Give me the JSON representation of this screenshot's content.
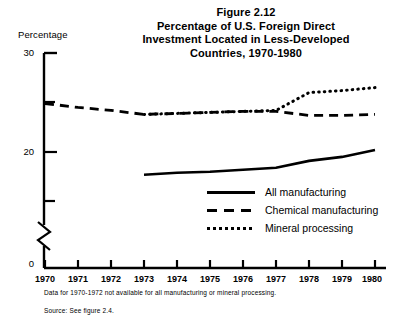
{
  "figure": {
    "title_lines": [
      "Figure 2.12",
      "Percentage of U.S. Foreign Direct",
      "Investment Located in Less-Developed",
      "Countries, 1970-1980"
    ],
    "footnote": "Data for 1970-1972 not available for all manufacturing or mineral processing.",
    "source": "Source: See figure 2.4."
  },
  "legend": {
    "items": [
      {
        "label": "All manufacturing",
        "style": "solid"
      },
      {
        "label": "Chemical manufacturing",
        "style": "dashed"
      },
      {
        "label": "Mineral processing",
        "style": "dotted"
      }
    ]
  },
  "chart_data": {
    "type": "line",
    "title": "Percentage of U.S. Foreign Direct Investment Located in Less-Developed Countries, 1970-1980",
    "xlabel": "",
    "ylabel": "Percentage",
    "x": [
      1970,
      1971,
      1972,
      1973,
      1974,
      1975,
      1976,
      1977,
      1978,
      1979,
      1980
    ],
    "xticklabels": [
      "1970",
      "1971",
      "1972",
      "1973",
      "1974",
      "1975",
      "1976",
      "1977",
      "1978",
      "1979",
      "1980"
    ],
    "yticks": [
      0,
      20,
      30
    ],
    "yticklabels": [
      "0",
      "20",
      "30"
    ],
    "y_minor_ticks": [
      17.5,
      25
    ],
    "ylim": [
      0,
      30
    ],
    "axis_break": true,
    "axis_break_note": "y-axis broken between 0 and ~16",
    "grid": false,
    "legend_position": "center-right inside plot",
    "series": [
      {
        "name": "All manufacturing",
        "style": "solid",
        "values": [
          null,
          null,
          null,
          17.7,
          17.9,
          18.0,
          18.2,
          18.4,
          19.1,
          19.5,
          20.2
        ]
      },
      {
        "name": "Chemical manufacturing",
        "style": "dashed",
        "values": [
          24.9,
          24.5,
          24.2,
          23.8,
          23.9,
          24.0,
          24.1,
          24.1,
          23.7,
          23.7,
          23.8
        ]
      },
      {
        "name": "Mineral processing",
        "style": "dotted",
        "values": [
          null,
          null,
          null,
          23.8,
          23.9,
          24.0,
          24.1,
          24.2,
          26.0,
          26.2,
          26.5
        ]
      }
    ]
  },
  "colors": {
    "ink": "#000000",
    "background": "#ffffff"
  }
}
